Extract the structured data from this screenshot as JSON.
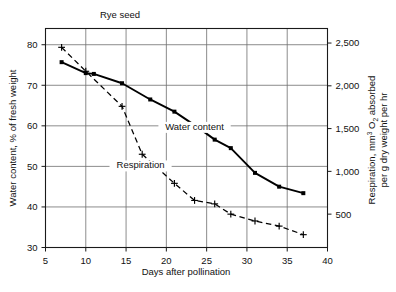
{
  "chart_data": {
    "type": "line",
    "title": "Rye seed",
    "xlabel": "Days after pollination",
    "ylabel": "Water content, % of fresh weight",
    "y2label": "Respiration, mm3 O2 absorbed per g dry weight per hr",
    "y2label_parts": {
      "line1_a": "Respiration, mm",
      "line1_sup": "3",
      "line1_b": " O",
      "line1_sub": "2",
      "line1_c": " absorbed",
      "line2": "per g dry weight per hr"
    },
    "grid": true,
    "legend_position": "inline-annotations",
    "xlim": [
      5,
      40
    ],
    "xticks": [
      5,
      10,
      15,
      20,
      25,
      30,
      35,
      40
    ],
    "xticklabels": [
      "5",
      "10",
      "15",
      "20",
      "25",
      "30",
      "35",
      "40"
    ],
    "ylim": [
      30,
      84
    ],
    "yticks": [
      30,
      40,
      50,
      60,
      70,
      80
    ],
    "yticklabels": [
      "30",
      "40",
      "50",
      "60",
      "70",
      "80"
    ],
    "y2lim": [
      110,
      2670
    ],
    "y2ticks": [
      500,
      1000,
      1500,
      2000,
      2500
    ],
    "y2ticklabels": [
      "500",
      "1,000",
      "1,500",
      "2,000",
      "2,500"
    ],
    "series": [
      {
        "name": "Water content",
        "label": "Water content",
        "axis": "left",
        "style": "solid",
        "marker": "square",
        "color": "#000000",
        "x": [
          7,
          10,
          11,
          14.5,
          18,
          21,
          24,
          26,
          28,
          31,
          34,
          37
        ],
        "values": [
          75.7,
          73.0,
          72.8,
          70.5,
          66.5,
          63.5,
          59.5,
          56.6,
          54.5,
          48.4,
          45.0,
          43.4
        ]
      },
      {
        "name": "Respiration",
        "label": "Respiration",
        "axis": "right",
        "style": "dashed",
        "marker": "plus",
        "color": "#000000",
        "x": [
          7,
          10,
          14.5,
          17,
          21,
          23.5,
          26,
          28,
          31,
          34,
          37
        ],
        "values": [
          2450,
          2170,
          1760,
          1200,
          860,
          660,
          620,
          500,
          420,
          360,
          260
        ]
      }
    ],
    "annotations": [
      {
        "text": "Water content",
        "x": 23.5,
        "y": 59.0
      },
      {
        "text": "Respiration",
        "x": 16.8,
        "y": 49.5
      }
    ]
  }
}
